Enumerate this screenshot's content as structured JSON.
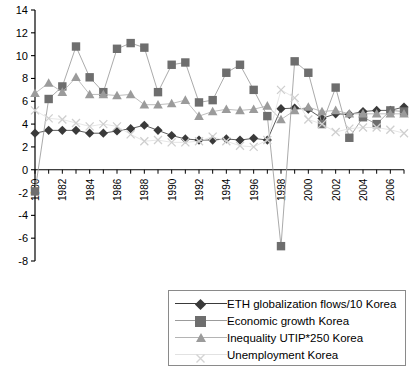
{
  "chart_data": {
    "type": "line",
    "title": "",
    "xlabel": "",
    "ylabel": "",
    "xlim": [
      1980,
      2007
    ],
    "ylim": [
      -8,
      14
    ],
    "ytick_step": 2,
    "grid": false,
    "legend_position": "bottom",
    "x": [
      1980,
      1981,
      1982,
      1983,
      1984,
      1985,
      1986,
      1987,
      1988,
      1989,
      1990,
      1991,
      1992,
      1993,
      1994,
      1995,
      1996,
      1997,
      1998,
      1999,
      2000,
      2001,
      2002,
      2003,
      2004,
      2005,
      2006,
      2007
    ],
    "xtick_labels": [
      "1980",
      "1982",
      "1984",
      "1986",
      "1988",
      "1990",
      "1992",
      "1994",
      "1996",
      "1998",
      "2000",
      "2002",
      "2004",
      "2006"
    ],
    "ytick_labels": [
      "14",
      "12",
      "10",
      "8",
      "6",
      "4",
      "2",
      "0",
      "-2",
      "-4",
      "-6",
      "-8"
    ],
    "series": [
      {
        "name": "ETH globalization flows/10 Korea",
        "marker": "diamond",
        "color": "#3a3a3a",
        "values": [
          3.2,
          3.45,
          3.45,
          3.45,
          3.2,
          3.2,
          3.4,
          3.6,
          3.9,
          3.45,
          3.0,
          2.7,
          2.6,
          2.6,
          2.7,
          2.6,
          2.75,
          2.6,
          5.35,
          5.4,
          5.3,
          4.5,
          4.9,
          4.85,
          5.1,
          5.2,
          5.2,
          5.5
        ]
      },
      {
        "name": "Economic growth Korea",
        "marker": "square",
        "color": "#6e6e6e",
        "values": [
          -1.9,
          6.2,
          7.3,
          10.8,
          8.1,
          6.8,
          10.6,
          11.1,
          10.7,
          6.8,
          9.2,
          9.4,
          5.9,
          6.1,
          8.5,
          9.2,
          7.0,
          4.7,
          -6.7,
          9.5,
          8.5,
          4.0,
          7.2,
          2.8,
          4.6,
          4.0,
          5.2,
          5.1
        ]
      },
      {
        "name": "Inequality UTIP*250 Korea",
        "marker": "triangle",
        "color": "#9b9b9b",
        "values": [
          6.7,
          7.6,
          6.8,
          8.1,
          6.6,
          6.6,
          6.5,
          6.6,
          5.7,
          5.7,
          5.8,
          6.1,
          4.7,
          5.1,
          5.3,
          5.2,
          5.3,
          5.6,
          4.4,
          5.2,
          5.5,
          5.1,
          5.2,
          4.9,
          4.9,
          4.9,
          4.9,
          4.9
        ]
      },
      {
        "name": "Unemployment Korea",
        "marker": "x",
        "color": "#cfcfcf",
        "values": [
          5.2,
          4.5,
          4.4,
          4.1,
          3.8,
          4.0,
          3.8,
          3.1,
          2.5,
          2.6,
          2.4,
          2.4,
          2.5,
          2.9,
          2.5,
          2.1,
          2.0,
          2.6,
          7.0,
          6.3,
          4.4,
          4.0,
          3.3,
          3.6,
          3.7,
          3.7,
          3.5,
          3.2
        ]
      }
    ]
  },
  "legend": {
    "items": [
      {
        "label": "ETH globalization flows/10 Korea"
      },
      {
        "label": "Economic growth Korea"
      },
      {
        "label": "Inequality UTIP*250 Korea"
      },
      {
        "label": "Unemployment Korea"
      }
    ]
  }
}
